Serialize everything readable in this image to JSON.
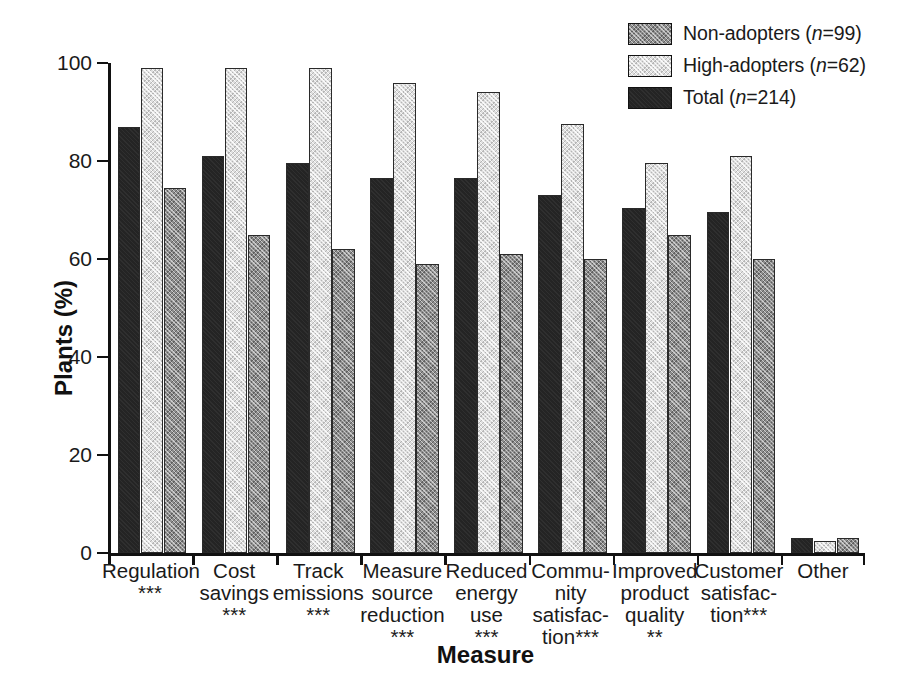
{
  "chart_data": {
    "type": "bar",
    "title": "",
    "xlabel": "Measure",
    "ylabel": "Plants (%)",
    "ylim": [
      0,
      100
    ],
    "yticks": [
      0,
      20,
      40,
      60,
      80,
      100
    ],
    "grid": false,
    "legend_position": "top-right",
    "categories": [
      "Regulation\n***",
      "Cost\nsavings\n***",
      "Track\nemissions\n***",
      "Measure\nsource\nreduction\n***",
      "Reduced\nenergy\nuse\n***",
      "Commu-\nnity\nsatisfac-\ntion***",
      "Improved\nproduct\nquality\n**",
      "Customer\nsatisfac-\ntion***",
      "Other"
    ],
    "series": [
      {
        "name": "Total (n=214)",
        "key": "total",
        "fill": "fill-total",
        "draw_order": 1,
        "values": [
          87,
          81,
          79.5,
          76.5,
          76.5,
          73,
          70.5,
          69.5,
          3
        ]
      },
      {
        "name": "High-adopters (n=62)",
        "key": "high_adopters",
        "fill": "fill-highadopters",
        "draw_order": 2,
        "values": [
          99,
          99,
          99,
          96,
          94,
          87.5,
          79.5,
          81,
          2.5
        ]
      },
      {
        "name": "Non-adopters (n=99)",
        "key": "non_adopters",
        "fill": "fill-nonadopters",
        "draw_order": 3,
        "values": [
          74.5,
          65,
          62,
          59,
          61,
          60,
          65,
          60,
          3
        ]
      }
    ]
  },
  "legend": {
    "entries": [
      {
        "label": "Non-adopters (n=99)",
        "label_pre": "Non-adopters (",
        "label_italic": "n",
        "label_post": "=99)",
        "fill": "fill-nonadopters"
      },
      {
        "label": "High-adopters (n=62)",
        "label_pre": "High-adopters (",
        "label_italic": "n",
        "label_post": "=62)",
        "fill": "fill-highadopters"
      },
      {
        "label": "Total (n=214)",
        "label_pre": "Total (",
        "label_italic": "n",
        "label_post": "=214)",
        "fill": "fill-total"
      }
    ]
  },
  "axes": {
    "y_title": "Plants (%)",
    "x_title": "Measure",
    "y_tick_labels": [
      "0",
      "20",
      "40",
      "60",
      "80",
      "100"
    ]
  }
}
